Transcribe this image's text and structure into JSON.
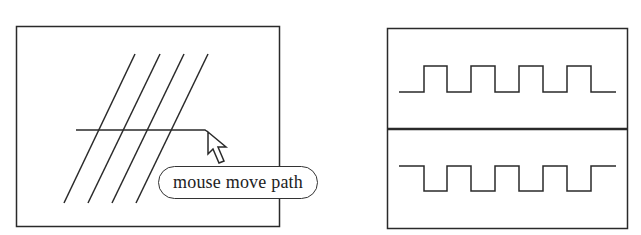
{
  "figure": {
    "left_panel": {
      "description": "four parallel diagonal lines crossed by a horizontal mouse path ending at a cursor arrow",
      "callout_label": "mouse move path",
      "icons": [
        "arrow-cursor-icon"
      ]
    },
    "right_panel": {
      "description": "two stacked panels each showing a square wave; bottom is inverted",
      "waves": [
        {
          "name": "top-wave",
          "polarity": "positive",
          "pulses": 4
        },
        {
          "name": "bottom-wave",
          "polarity": "negative",
          "pulses": 4
        }
      ]
    },
    "colors": {
      "stroke": "#222222",
      "background": "#ffffff"
    }
  }
}
